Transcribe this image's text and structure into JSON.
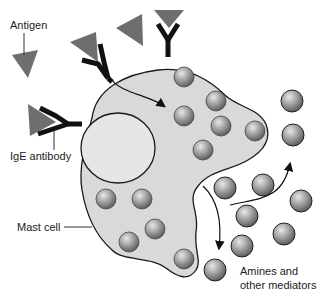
{
  "figure": {
    "labels": {
      "antigen": "Antigen",
      "ige_antibody": "IgE antibody",
      "mast_cell": "Mast cell",
      "mediators_line1": "Amines and",
      "mediators_line2": "other mediators"
    },
    "colors": {
      "cell_fill": "#d9d9d9",
      "nucleus_fill": "#e6e6e6",
      "outline": "#1a1a1a",
      "antigen": "#6e6e6e",
      "antibody": "#111111",
      "granule_light": "#d0d0d0",
      "granule_dark": "#5a5a5a",
      "background": "#ffffff"
    },
    "elements": {
      "antigens_free": 2,
      "antigen_antibody_complexes": 3,
      "granules_inside_cell": 10,
      "granules_released": 10
    }
  }
}
